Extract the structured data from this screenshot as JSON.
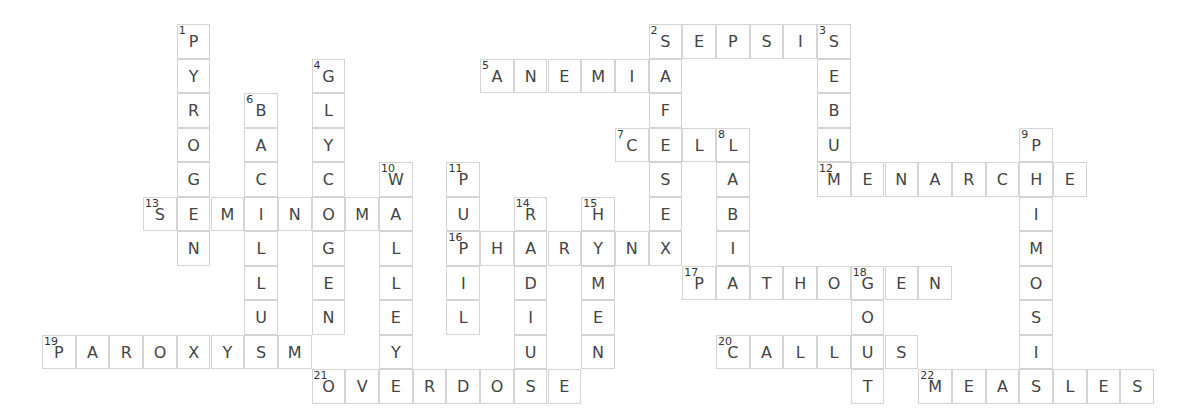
{
  "puzzle": {
    "type": "crossword",
    "cell_width": 33.7,
    "cell_height": 34.5,
    "origin_x": 42,
    "origin_y": 24,
    "colors": {
      "border": "#d4d4d4",
      "letter": "#444444",
      "number": "#333333",
      "background": "#ffffff"
    },
    "entries": [
      {
        "number": "1",
        "direction": "down",
        "answer": "PYROGEN",
        "row": 0,
        "col": 4
      },
      {
        "number": "2",
        "direction": "across",
        "answer": "SEPSIS",
        "row": 0,
        "col": 18
      },
      {
        "number": "2",
        "direction": "down",
        "answer": "SAFESEX",
        "row": 0,
        "col": 18
      },
      {
        "number": "3",
        "direction": "down",
        "answer": "SEBUM",
        "row": 0,
        "col": 23
      },
      {
        "number": "4",
        "direction": "down",
        "answer": "GLYCOGEN",
        "row": 1,
        "col": 8
      },
      {
        "number": "5",
        "direction": "across",
        "answer": "ANEMIA",
        "row": 1,
        "col": 13
      },
      {
        "number": "6",
        "direction": "down",
        "answer": "BACILLUS",
        "row": 2,
        "col": 6
      },
      {
        "number": "7",
        "direction": "across",
        "answer": "CELL",
        "row": 3,
        "col": 17
      },
      {
        "number": "8",
        "direction": "down",
        "answer": "LABIA",
        "row": 3,
        "col": 20
      },
      {
        "number": "9",
        "direction": "down",
        "answer": "PHIMOSIS",
        "row": 3,
        "col": 29
      },
      {
        "number": "10",
        "direction": "down",
        "answer": "WALLEYE",
        "row": 4,
        "col": 10
      },
      {
        "number": "11",
        "direction": "down",
        "answer": "PUPIL",
        "row": 4,
        "col": 12
      },
      {
        "number": "12",
        "direction": "across",
        "answer": "MENARCHE",
        "row": 4,
        "col": 23
      },
      {
        "number": "13",
        "direction": "across",
        "answer": "SEMINOMA",
        "row": 5,
        "col": 3
      },
      {
        "number": "14",
        "direction": "down",
        "answer": "RADIUS",
        "row": 5,
        "col": 14
      },
      {
        "number": "15",
        "direction": "down",
        "answer": "HYMEN",
        "row": 5,
        "col": 16
      },
      {
        "number": "16",
        "direction": "across",
        "answer": "PHARYNX",
        "row": 6,
        "col": 12
      },
      {
        "number": "17",
        "direction": "across",
        "answer": "PATHOGEN",
        "row": 7,
        "col": 19
      },
      {
        "number": "18",
        "direction": "down",
        "answer": "GOUT",
        "row": 7,
        "col": 24
      },
      {
        "number": "19",
        "direction": "across",
        "answer": "PAROXYSM",
        "row": 9,
        "col": 0
      },
      {
        "number": "20",
        "direction": "across",
        "answer": "CALLUS",
        "row": 9,
        "col": 20
      },
      {
        "number": "21",
        "direction": "across",
        "answer": "OVERDOSE",
        "row": 10,
        "col": 8
      },
      {
        "number": "22",
        "direction": "across",
        "answer": "MEASLES",
        "row": 10,
        "col": 26
      }
    ]
  }
}
